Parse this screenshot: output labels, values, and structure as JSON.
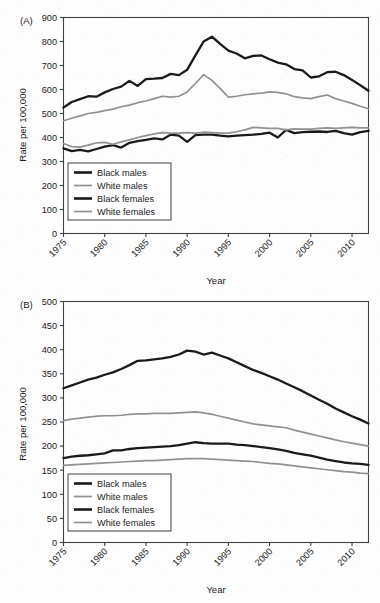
{
  "figure": {
    "background": "#fdfdfd",
    "axis_color": "#404040",
    "text_color": "#1a1a1a"
  },
  "panels": [
    {
      "id": "A",
      "tag": "(A)",
      "ylabel": "Rate per 100,000",
      "xlabel": "Year",
      "legend": [
        {
          "label": "Black males",
          "color": "#1a1a1a",
          "width": 2.6
        },
        {
          "label": "White males",
          "color": "#919191",
          "width": 1.7
        },
        {
          "label": "Black females",
          "color": "#1a1a1a",
          "width": 2.6
        },
        {
          "label": "White females",
          "color": "#919191",
          "width": 1.7
        }
      ]
    },
    {
      "id": "B",
      "tag": "(B)",
      "ylabel": "Rate per 100,000",
      "xlabel": "Year",
      "legend": [
        {
          "label": "Black males",
          "color": "#1a1a1a",
          "width": 2.6
        },
        {
          "label": "White males",
          "color": "#919191",
          "width": 1.7
        },
        {
          "label": "Black females",
          "color": "#1a1a1a",
          "width": 2.6
        },
        {
          "label": "White females",
          "color": "#919191",
          "width": 1.7
        }
      ]
    }
  ],
  "chart_data": [
    {
      "panel": "A",
      "type": "line",
      "title": "(A)",
      "xlabel": "Year",
      "ylabel": "Rate per 100,000",
      "xlim": [
        1975,
        2012
      ],
      "ylim": [
        0,
        900
      ],
      "yticks": [
        0,
        100,
        200,
        300,
        400,
        500,
        600,
        700,
        800,
        900
      ],
      "xticks": [
        1975,
        1980,
        1985,
        1990,
        1995,
        2000,
        2005,
        2010
      ],
      "grid": false,
      "legend_position": "lower-left",
      "x": [
        1975,
        1976,
        1977,
        1978,
        1979,
        1980,
        1981,
        1982,
        1983,
        1984,
        1985,
        1986,
        1987,
        1988,
        1989,
        1990,
        1991,
        1992,
        1993,
        1994,
        1995,
        1996,
        1997,
        1998,
        1999,
        2000,
        2001,
        2002,
        2003,
        2004,
        2005,
        2006,
        2007,
        2008,
        2009,
        2010,
        2011,
        2012
      ],
      "series": [
        {
          "name": "Black males",
          "color": "#1a1a1a",
          "values": [
            525,
            548,
            560,
            572,
            570,
            588,
            602,
            612,
            636,
            615,
            643,
            645,
            648,
            665,
            660,
            682,
            742,
            800,
            820,
            790,
            762,
            750,
            730,
            740,
            742,
            726,
            712,
            705,
            685,
            680,
            650,
            655,
            672,
            674,
            660,
            640,
            618,
            595
          ]
        },
        {
          "name": "White males",
          "color": "#919191",
          "values": [
            470,
            480,
            490,
            500,
            505,
            512,
            518,
            528,
            535,
            545,
            552,
            562,
            572,
            568,
            572,
            590,
            625,
            662,
            638,
            605,
            568,
            572,
            578,
            582,
            585,
            590,
            588,
            582,
            570,
            565,
            562,
            570,
            577,
            562,
            552,
            542,
            530,
            520
          ]
        },
        {
          "name": "Black females",
          "color": "#1a1a1a",
          "values": [
            355,
            343,
            348,
            342,
            352,
            362,
            368,
            358,
            378,
            385,
            390,
            396,
            392,
            412,
            408,
            382,
            410,
            412,
            412,
            408,
            405,
            408,
            410,
            412,
            415,
            420,
            400,
            432,
            418,
            422,
            424,
            425,
            423,
            428,
            418,
            412,
            422,
            428
          ]
        },
        {
          "name": "White females",
          "color": "#919191",
          "values": [
            375,
            362,
            360,
            368,
            378,
            380,
            372,
            382,
            390,
            400,
            408,
            415,
            420,
            418,
            418,
            420,
            418,
            422,
            420,
            418,
            418,
            424,
            432,
            442,
            440,
            438,
            438,
            432,
            436,
            435,
            435,
            438,
            440,
            438,
            440,
            442,
            440,
            440
          ]
        }
      ]
    },
    {
      "panel": "B",
      "type": "line",
      "title": "(B)",
      "xlabel": "Year",
      "ylabel": "Rate per 100,000",
      "xlim": [
        1975,
        2012
      ],
      "ylim": [
        0,
        500
      ],
      "yticks": [
        0,
        50,
        100,
        150,
        200,
        250,
        300,
        350,
        400,
        450,
        500
      ],
      "xticks": [
        1975,
        1980,
        1985,
        1990,
        1995,
        2000,
        2005,
        2010
      ],
      "grid": false,
      "legend_position": "lower-left",
      "x": [
        1975,
        1976,
        1977,
        1978,
        1979,
        1980,
        1981,
        1982,
        1983,
        1984,
        1985,
        1986,
        1987,
        1988,
        1989,
        1990,
        1991,
        1992,
        1993,
        1994,
        1995,
        1996,
        1997,
        1998,
        1999,
        2000,
        2001,
        2002,
        2003,
        2004,
        2005,
        2006,
        2007,
        2008,
        2009,
        2010,
        2011,
        2012
      ],
      "series": [
        {
          "name": "Black males",
          "color": "#1a1a1a",
          "values": [
            320,
            326,
            332,
            338,
            342,
            348,
            353,
            360,
            368,
            377,
            378,
            380,
            382,
            385,
            390,
            398,
            396,
            390,
            394,
            388,
            382,
            374,
            366,
            358,
            352,
            345,
            338,
            330,
            322,
            314,
            305,
            296,
            288,
            278,
            270,
            262,
            255,
            247
          ]
        },
        {
          "name": "White males",
          "color": "#919191",
          "values": [
            253,
            256,
            258,
            260,
            262,
            263,
            263,
            264,
            266,
            267,
            267,
            268,
            268,
            268,
            269,
            270,
            271,
            269,
            266,
            262,
            258,
            254,
            250,
            246,
            244,
            242,
            240,
            238,
            233,
            229,
            225,
            221,
            217,
            213,
            209,
            206,
            203,
            200
          ]
        },
        {
          "name": "Black females",
          "color": "#1a1a1a",
          "values": [
            175,
            178,
            180,
            181,
            183,
            185,
            191,
            191,
            194,
            196,
            197,
            198,
            199,
            200,
            202,
            205,
            208,
            206,
            205,
            205,
            205,
            203,
            202,
            200,
            198,
            196,
            193,
            190,
            186,
            183,
            180,
            176,
            172,
            169,
            166,
            164,
            163,
            161
          ]
        },
        {
          "name": "White females",
          "color": "#919191",
          "values": [
            160,
            161,
            162,
            163,
            164,
            165,
            166,
            167,
            168,
            169,
            170,
            170,
            171,
            172,
            173,
            174,
            174,
            174,
            173,
            172,
            171,
            170,
            169,
            168,
            166,
            164,
            163,
            161,
            159,
            157,
            155,
            153,
            151,
            149,
            147,
            146,
            144,
            143
          ]
        }
      ]
    }
  ]
}
